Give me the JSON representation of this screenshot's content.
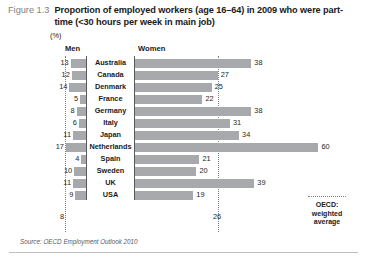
{
  "figure": {
    "number": "Figure 1.3",
    "title": "Proportion of employed workers (age 16–64) in 2009 who were part-time (<30 hours per week in main job)",
    "unit_label": "(%)",
    "source": "Source: OECD Employment Outlook 2010"
  },
  "legend": {
    "label": "OECD:\nweighted\naverage",
    "line1": "OECD:",
    "line2": "weighted",
    "line3": "average",
    "style": "dotted",
    "color": "#808285"
  },
  "columns": {
    "men": "Men",
    "women": "Women"
  },
  "averages": {
    "men": "8",
    "women": "26"
  },
  "colors": {
    "bar": "#a7a9ac",
    "axis": "#58595b",
    "average_line": "#808285",
    "text": "#231f20",
    "figure_number": "#808285",
    "background": "#ffffff"
  },
  "rows": [
    {
      "country": "Australia",
      "men": "13",
      "women": "38"
    },
    {
      "country": "Canada",
      "men": "12",
      "women": "27"
    },
    {
      "country": "Denmark",
      "men": "14",
      "women": "25"
    },
    {
      "country": "France",
      "men": "5",
      "women": "22"
    },
    {
      "country": "Germany",
      "men": "8",
      "women": "38"
    },
    {
      "country": "Italy",
      "men": "6",
      "women": "31"
    },
    {
      "country": "Japan",
      "men": "11",
      "women": "34"
    },
    {
      "country": "Netherlands",
      "men": "17",
      "women": "60"
    },
    {
      "country": "Spain",
      "men": "4",
      "women": "21"
    },
    {
      "country": "Sweden",
      "men": "10",
      "women": "20"
    },
    {
      "country": "UK",
      "men": "11",
      "women": "39"
    },
    {
      "country": "USA",
      "men": "9",
      "women": "19"
    }
  ],
  "chart_data": {
    "type": "bar",
    "orientation": "horizontal",
    "layout": "butterfly",
    "title": "Proportion of employed workers (age 16–64) in 2009 who were part-time (<30 hours per week in main job)",
    "xlabel": "(%)",
    "ylabel": "",
    "grid": false,
    "legend_position": "bottom-right",
    "categories": [
      "Australia",
      "Canada",
      "Denmark",
      "France",
      "Germany",
      "Italy",
      "Japan",
      "Netherlands",
      "Spain",
      "Sweden",
      "UK",
      "USA"
    ],
    "series": [
      {
        "name": "Men",
        "values": [
          13,
          12,
          14,
          5,
          8,
          6,
          11,
          17,
          4,
          10,
          11,
          9
        ],
        "direction": "left",
        "average": 8
      },
      {
        "name": "Women",
        "values": [
          38,
          27,
          25,
          22,
          38,
          31,
          34,
          60,
          21,
          20,
          39,
          19
        ],
        "direction": "right",
        "average": 26
      }
    ],
    "annotations": [
      {
        "text": "OECD: weighted average",
        "type": "legend",
        "style": "dotted-line"
      }
    ],
    "xlim_men": [
      0,
      20
    ],
    "xlim_women": [
      0,
      62
    ]
  }
}
